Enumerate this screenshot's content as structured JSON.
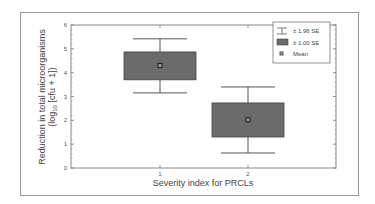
{
  "chart_data": {
    "type": "box",
    "title": "",
    "xlabel": "Severity index for PRCLs",
    "ylabel_line1": "Reduction in total microorganisms",
    "ylabel_line2": "(log10 [cfu + 1])",
    "ylim": [
      0,
      6
    ],
    "yticks": [
      "0",
      "1",
      "2",
      "3",
      "4",
      "5",
      "6"
    ],
    "categories": [
      "1",
      "2"
    ],
    "series": [
      {
        "category": "1",
        "mean": 4.3,
        "se1_low": 3.7,
        "se1_high": 4.87,
        "se196_low": 3.15,
        "se196_high": 5.42
      },
      {
        "category": "2",
        "mean": 2.02,
        "se1_low": 1.3,
        "se1_high": 2.73,
        "se196_low": 0.63,
        "se196_high": 3.4
      }
    ],
    "legend": {
      "position": "top-right",
      "entries": [
        {
          "label": "± 1.96 SE",
          "symbol": "whisker"
        },
        {
          "label": "± 1.00 SE",
          "symbol": "box"
        },
        {
          "label": "Mean",
          "symbol": "square-marker"
        }
      ]
    },
    "colors": {
      "box_fill": "#6b6b6b",
      "box_stroke": "#444444",
      "axis": "#888888",
      "whisker": "#555555"
    },
    "grid": false
  }
}
